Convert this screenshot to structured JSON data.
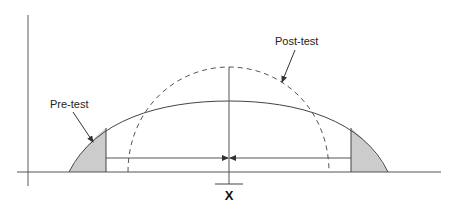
{
  "diagram": {
    "type": "distribution-comparison",
    "labels": {
      "pre_test": "Pre-test",
      "post_test": "Post-test",
      "mean": "X"
    },
    "curves": [
      {
        "name": "Pre-test",
        "style": "solid",
        "peak": "lower, wider",
        "shaded_tails": true
      },
      {
        "name": "Post-test",
        "style": "dashed",
        "peak": "higher, narrower",
        "shaded_tails": false
      }
    ],
    "annotations": {
      "arrows": "two horizontal arrows pointing inward from shaded tail boundaries to mean line",
      "shaded_fill": "#cccccc"
    },
    "colors": {
      "line": "#444444",
      "shaded": "#cccccc",
      "background": "#ffffff"
    }
  }
}
